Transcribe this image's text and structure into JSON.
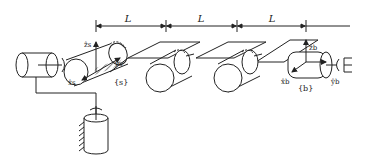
{
  "diagram": {
    "type": "robot-arm-kinematics",
    "dimensions": [
      {
        "label": "L"
      },
      {
        "label": "L"
      },
      {
        "label": "L"
      }
    ],
    "frames": {
      "space": {
        "label": "{s}",
        "axes": {
          "x": "x̂s",
          "y": "ŷs",
          "z": "ẑs"
        }
      },
      "body": {
        "label": "{b}",
        "axes": {
          "x": "x̂b",
          "y": "ŷb",
          "z": "ẑb"
        }
      }
    },
    "components": [
      "base-joint",
      "revolute-joint-1",
      "link-1",
      "revolute-joint-2",
      "link-2",
      "revolute-joint-3",
      "link-3",
      "end-effector-cylinder",
      "gripper",
      "ground-support"
    ],
    "colors": {
      "stroke": "#222222",
      "background": "#ffffff"
    }
  }
}
